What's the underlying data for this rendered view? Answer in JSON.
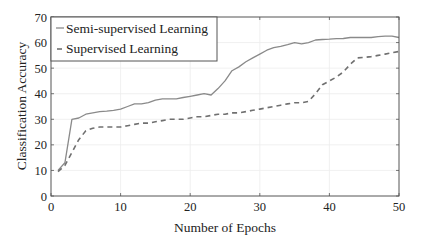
{
  "chart_data": {
    "type": "line",
    "title": "",
    "xlabel": "Number of Epochs",
    "ylabel": "Classification Accuracy",
    "xlim": [
      0,
      50
    ],
    "ylim": [
      0,
      70
    ],
    "xticks": [
      0,
      10,
      20,
      30,
      40,
      50
    ],
    "yticks": [
      0,
      10,
      20,
      30,
      40,
      50,
      60,
      70
    ],
    "grid": true,
    "legend_position": "upper left",
    "x": [
      1,
      2,
      3,
      4,
      5,
      6,
      7,
      8,
      9,
      10,
      11,
      12,
      13,
      14,
      15,
      16,
      17,
      18,
      19,
      20,
      21,
      22,
      23,
      24,
      25,
      26,
      27,
      28,
      29,
      30,
      31,
      32,
      33,
      34,
      35,
      36,
      37,
      38,
      39,
      40,
      41,
      42,
      43,
      44,
      45,
      46,
      47,
      48,
      49,
      50
    ],
    "series": [
      {
        "name": "Semi-supervised Learning",
        "style": "solid",
        "color": "#8a8a8a",
        "values": [
          10,
          13,
          30,
          30.5,
          32,
          32.5,
          33,
          33.2,
          33.5,
          34,
          35,
          36,
          36,
          36.5,
          37.5,
          38,
          38,
          38,
          38.5,
          39,
          39.5,
          40,
          39.5,
          42,
          45,
          49,
          50.5,
          52.5,
          54,
          55.5,
          57,
          58,
          58.5,
          59.2,
          60,
          59.5,
          60,
          61,
          61.2,
          61.3,
          61.5,
          61.6,
          62,
          62,
          62,
          62,
          62.3,
          62.5,
          62.5,
          62
        ]
      },
      {
        "name": "Supervised Learning",
        "style": "dashed",
        "color": "#707070",
        "values": [
          9.5,
          12,
          17,
          22,
          25.5,
          26.5,
          27,
          27,
          27,
          27,
          27.5,
          28,
          28.5,
          28.5,
          29,
          29.5,
          30,
          30,
          30,
          30.5,
          31,
          31,
          31.5,
          32,
          32,
          32.5,
          32.5,
          33,
          33.5,
          34,
          34.5,
          35,
          35.5,
          36,
          36.5,
          36.5,
          37,
          40,
          43.5,
          45,
          46.5,
          48.5,
          51.5,
          54,
          54.2,
          54.5,
          55,
          55.5,
          56,
          56.5
        ]
      }
    ]
  }
}
